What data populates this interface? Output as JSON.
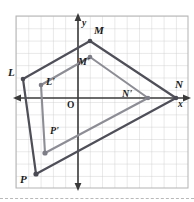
{
  "figure": {
    "caption_axes": {
      "x_axis_label": "x",
      "y_axis_label": "y",
      "origin_label": "O"
    },
    "colors": {
      "grid": "#c8c8c8",
      "grid_outer": "#b0b0b0",
      "axis": "#3a3a3a",
      "preimage_stroke": "#4d4d57",
      "image_stroke": "#8a8a92",
      "vertex_fill": "#6e6e78",
      "label_text": "#1a1a1a",
      "background": "#ffffff"
    },
    "grid": {
      "cell_px": 12.3,
      "left_px": 16,
      "top_px": 16,
      "right_px": 188,
      "bottom_px": 188,
      "origin_x_px": 78,
      "origin_y_px": 98,
      "columns": 14,
      "rows": 14
    },
    "labels": [
      {
        "name": "M",
        "text": "M",
        "x": 94,
        "y": 31
      },
      {
        "name": "M'",
        "text": "M'",
        "x": 80,
        "y": 61
      },
      {
        "name": "L",
        "text": "L",
        "x": 11,
        "y": 70
      },
      {
        "name": "L'",
        "text": "L'",
        "x": 47,
        "y": 79
      },
      {
        "name": "N",
        "text": "N",
        "x": 176,
        "y": 84
      },
      {
        "name": "N'",
        "text": "N'",
        "x": 124,
        "y": 91
      },
      {
        "name": "P'",
        "text": "P'",
        "x": 51,
        "y": 129
      },
      {
        "name": "P",
        "text": "P",
        "x": 22,
        "y": 176
      }
    ],
    "preimage": {
      "name": "quadrilateral-LMNP",
      "vertices": [
        {
          "label": "L",
          "x": 23,
          "y": 79
        },
        {
          "label": "M",
          "x": 90,
          "y": 41
        },
        {
          "label": "N",
          "x": 176,
          "y": 98
        },
        {
          "label": "P",
          "x": 36,
          "y": 174
        }
      ]
    },
    "image": {
      "name": "quadrilateral-L-prime-M-prime-N-prime-P-prime",
      "vertices": [
        {
          "label": "L'",
          "x": 41,
          "y": 85
        },
        {
          "label": "M'",
          "x": 90,
          "y": 57
        },
        {
          "label": "N'",
          "x": 148,
          "y": 98
        },
        {
          "label": "P'",
          "x": 45,
          "y": 153
        }
      ]
    }
  }
}
